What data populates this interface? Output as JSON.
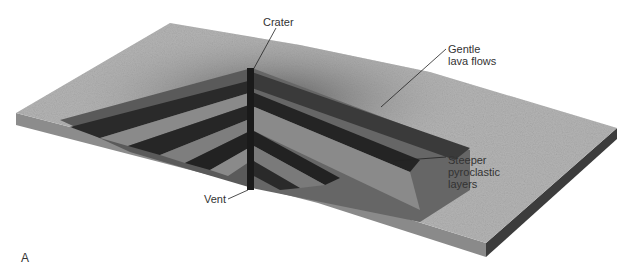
{
  "figure": {
    "panel_label": "A",
    "labels": {
      "crater": "Crater",
      "gentle_lava_flows": "Gentle\nlava flows",
      "steeper_pyroclastic_layers": "Steeper\npyroclastic\nlayers",
      "vent": "Vent"
    },
    "colors": {
      "surface": "#b4b4b4",
      "surface_dark": "#6e6e6e",
      "slab_side_front": "#8c8c8c",
      "slab_side_right": "#3c3c3c",
      "lava_layer": "#2a2a2a",
      "pyroclastic_layer": "#8a8a8a",
      "vent": "#1a1a1a",
      "leader_line": "#222222",
      "text": "#333333"
    }
  }
}
